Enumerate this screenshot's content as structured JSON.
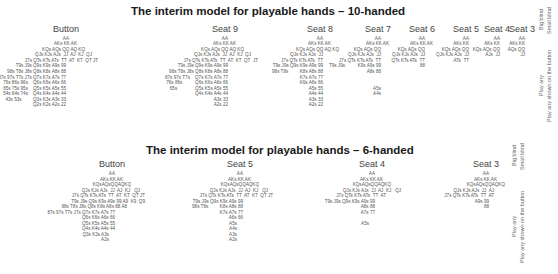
{
  "top": {
    "title": "The interim model for playable hands – 10-handed",
    "seats": [
      {
        "name": "Button",
        "cx": 66,
        "rows": [
          {
            "y": 36,
            "right": 69,
            "text": "AA"
          },
          {
            "y": 41,
            "right": 77,
            "text": "AKs KK AK"
          },
          {
            "y": 47,
            "right": 85,
            "text": "KQs AQs QQ AQ KQ"
          },
          {
            "y": 52,
            "right": 92,
            "text": "QJs KJs AJs  JJ  AJ  KJ  QJ"
          },
          {
            "y": 58,
            "right": 98,
            "text": "J7s QTs KTs ATs  TT  AT  KT  QT JT"
          },
          {
            "y": 63,
            "right": 66,
            "text": "T9s J9s Q9s K9s A9s 99"
          },
          {
            "y": 69,
            "right": 66,
            "text": "98s T8s J8s Q8s K8s A8s 88"
          },
          {
            "y": 75,
            "right": 66,
            "text": "87s 97s T7s J7s Q7s K7s A7s 77"
          },
          {
            "y": 80,
            "right": 66,
            "text": "76s 86s 96s    Q6s K6s A6s 66"
          },
          {
            "y": 86,
            "right": 66,
            "text": "65s 75s 95s    Q5s K5s A5s 55"
          },
          {
            "y": 91,
            "right": 66,
            "text": "54s 64s 74s    Q4s K4s A4s 44"
          },
          {
            "y": 97,
            "right": 66,
            "text": "43s 53s         Q3s K3s A3s 33"
          },
          {
            "y": 102,
            "right": 66,
            "text": "Q2s K2s A2s 22"
          }
        ]
      },
      {
        "name": "Seat 9",
        "cx": 225,
        "rows": [
          {
            "y": 36,
            "right": 228,
            "text": "AA"
          },
          {
            "y": 41,
            "right": 236,
            "text": "AKs KK AK"
          },
          {
            "y": 47,
            "right": 244,
            "text": "KQs AQs QQ AQ KQ"
          },
          {
            "y": 52,
            "right": 251,
            "text": "QJs KJs AJs  JJ  AJ  KJ  QJ"
          },
          {
            "y": 58,
            "right": 258,
            "text": "J7s QTs KTs ATs  TT  AT  KT  QT  JT"
          },
          {
            "y": 63,
            "right": 228,
            "text": "T9s J9s Q9s K9s A9s 99"
          },
          {
            "y": 69,
            "right": 228,
            "text": "98s T8s J8s Q8s K8s A8s 88"
          },
          {
            "y": 75,
            "right": 228,
            "text": "87s 97s T7s    Q7s K7s A7s 77"
          },
          {
            "y": 80,
            "right": 228,
            "text": "76s 86s          Q6s K6s A6s 66"
          },
          {
            "y": 86,
            "right": 228,
            "text": "65s              Q5s K5s A5s 55"
          },
          {
            "y": 91,
            "right": 228,
            "text": "Q4s K4s A4s 44"
          },
          {
            "y": 97,
            "right": 228,
            "text": "A3s 33"
          },
          {
            "y": 102,
            "right": 228,
            "text": "A2s 22"
          }
        ]
      },
      {
        "name": "Seat 8",
        "cx": 320,
        "rows": [
          {
            "y": 36,
            "right": 323,
            "text": "AA"
          },
          {
            "y": 41,
            "right": 331,
            "text": "AKs KK AK"
          },
          {
            "y": 47,
            "right": 339,
            "text": "KQs AQs QQ AQ KQ"
          },
          {
            "y": 52,
            "right": 323,
            "text": "QJs KJs AJs  JJ"
          },
          {
            "y": 58,
            "right": 323,
            "text": "J7s QTs KTs ATs  TT"
          },
          {
            "y": 63,
            "right": 323,
            "text": "T9s J9s Q9s K9s A9s 99"
          },
          {
            "y": 69,
            "right": 323,
            "text": "98s T8s         K8s A8s 88"
          },
          {
            "y": 75,
            "right": 323,
            "text": "K7s A7s 77"
          },
          {
            "y": 80,
            "right": 323,
            "text": "K6s A6s 66"
          },
          {
            "y": 86,
            "right": 323,
            "text": "A5s 55"
          },
          {
            "y": 91,
            "right": 323,
            "text": "A4s 44"
          },
          {
            "y": 97,
            "right": 323,
            "text": "A3s 33"
          },
          {
            "y": 102,
            "right": 323,
            "text": "A2s 22"
          }
        ]
      },
      {
        "name": "Seat 7",
        "cx": 378,
        "rows": [
          {
            "y": 36,
            "right": 381,
            "text": "AA"
          },
          {
            "y": 41,
            "right": 389,
            "text": "AKs KK AK"
          },
          {
            "y": 47,
            "right": 381,
            "text": "KQs AQs QQ"
          },
          {
            "y": 52,
            "right": 381,
            "text": "QJs KJs AJs  JJ"
          },
          {
            "y": 58,
            "right": 381,
            "text": "J7s QTs KTs ATs  TT"
          },
          {
            "y": 63,
            "right": 381,
            "text": "T9s J9s          K9s A9s 99"
          },
          {
            "y": 69,
            "right": 381,
            "text": "A8s 88"
          },
          {
            "y": 86,
            "right": 381,
            "text": "A5s"
          },
          {
            "y": 91,
            "right": 381,
            "text": "A4s"
          }
        ]
      },
      {
        "name": "Seat 6",
        "cx": 422,
        "rows": [
          {
            "y": 36,
            "right": 425,
            "text": "AA"
          },
          {
            "y": 41,
            "right": 433,
            "text": "AKs KK AK"
          },
          {
            "y": 47,
            "right": 425,
            "text": "KQs AQs QQ"
          },
          {
            "y": 52,
            "right": 425,
            "text": "QJs KJs AJs  JJ"
          },
          {
            "y": 58,
            "right": 425,
            "text": "QTs KTs ATs  TT"
          },
          {
            "y": 63,
            "right": 425,
            "text": "88"
          }
        ]
      },
      {
        "name": "Seat 5",
        "cx": 466,
        "rows": [
          {
            "y": 36,
            "right": 469,
            "text": "AA"
          },
          {
            "y": 41,
            "right": 469,
            "text": "AKs KK"
          },
          {
            "y": 47,
            "right": 469,
            "text": "KQs AQs QQ"
          },
          {
            "y": 52,
            "right": 469,
            "text": "QJs KJs AJs  JJ"
          },
          {
            "y": 58,
            "right": 469,
            "text": "ATs  TT"
          }
        ]
      },
      {
        "name": "Seat 4",
        "cx": 497,
        "rows": [
          {
            "y": 36,
            "right": 500,
            "text": "AA"
          },
          {
            "y": 41,
            "right": 500,
            "text": "AKs KK"
          },
          {
            "y": 47,
            "right": 500,
            "text": "KQs AQs QQ"
          },
          {
            "y": 52,
            "right": 500,
            "text": "AJs  JJ"
          }
        ]
      },
      {
        "name": "Seat 3",
        "cx": 522,
        "rows": [
          {
            "y": 36,
            "right": 525,
            "text": "AA"
          },
          {
            "y": 41,
            "right": 525,
            "text": "AKs KK"
          },
          {
            "y": 47,
            "right": 525,
            "text": "AQs QQ"
          },
          {
            "y": 52,
            "right": 525,
            "text": "JJ"
          }
        ]
      }
    ],
    "side_labels": [
      "Big blind",
      "Small blind",
      "Play any",
      "Play any shown on the button"
    ]
  },
  "bottom": {
    "title": "The interim model for playable hands – 6-handed",
    "seats": [
      {
        "name": "Button",
        "cx": 112,
        "rows": [
          {
            "y": 171,
            "right": 115,
            "text": "AA"
          },
          {
            "y": 177,
            "right": 123,
            "text": "AKs KK AK"
          },
          {
            "y": 182,
            "right": 131,
            "text": "KQsAQsQQAQKQ"
          },
          {
            "y": 188,
            "right": 140,
            "text": "QJs KJs AJs  JJ  AJ  KJ   QJ"
          },
          {
            "y": 193,
            "right": 145,
            "text": "J7s QTs KTs ATs  TT  AT  KT  QT JT"
          },
          {
            "y": 199,
            "right": 145,
            "text": "T9s J9s Q9s K9s A9s 99 A9  K9  Q9"
          },
          {
            "y": 204,
            "right": 127,
            "text": "98s T8s J8s Q8s K8s A8s 88 A8"
          },
          {
            "y": 210,
            "right": 115,
            "text": "87s 97s T7s J7s Q7s K7s A7s 77"
          },
          {
            "y": 215,
            "right": 115,
            "text": "Q6s K6s A6s 66"
          },
          {
            "y": 221,
            "right": 115,
            "text": "Q5s K5s A5s 55"
          },
          {
            "y": 226,
            "right": 115,
            "text": "Q4s K4s A4s 44"
          },
          {
            "y": 232,
            "right": 109,
            "text": "Q3s K3s A3s"
          },
          {
            "y": 237,
            "right": 109,
            "text": "A2s"
          }
        ]
      },
      {
        "name": "Seat 5",
        "cx": 240,
        "rows": [
          {
            "y": 171,
            "right": 243,
            "text": "AA"
          },
          {
            "y": 177,
            "right": 251,
            "text": "AKs KK AK"
          },
          {
            "y": 182,
            "right": 259,
            "text": "KQsAQsQQAQKQ"
          },
          {
            "y": 188,
            "right": 268,
            "text": "QJs KJs AJs  JJ  AJ  KJ   QJ"
          },
          {
            "y": 193,
            "right": 273,
            "text": "J7s QTs KTs ATs  TT  AT  KT  QT JT"
          },
          {
            "y": 199,
            "right": 243,
            "text": "T9s J9s Q9s K9s A9s 99"
          },
          {
            "y": 204,
            "right": 243,
            "text": "98s T8s         K8s A8s 88"
          },
          {
            "y": 210,
            "right": 243,
            "text": "K7s A7s 77"
          },
          {
            "y": 215,
            "right": 243,
            "text": "A6s 66"
          },
          {
            "y": 221,
            "right": 237,
            "text": "A5s"
          },
          {
            "y": 226,
            "right": 237,
            "text": "A4s"
          },
          {
            "y": 232,
            "right": 237,
            "text": "A3s"
          },
          {
            "y": 237,
            "right": 237,
            "text": "A2s"
          }
        ]
      },
      {
        "name": "Seat 4",
        "cx": 372,
        "rows": [
          {
            "y": 171,
            "right": 375,
            "text": "AA"
          },
          {
            "y": 177,
            "right": 383,
            "text": "AKs KK AK"
          },
          {
            "y": 182,
            "right": 391,
            "text": "KQsAQsQQAQKQ"
          },
          {
            "y": 188,
            "right": 401,
            "text": "QJs KJs AJs  JJ  AJ  KJ   QJ"
          },
          {
            "y": 193,
            "right": 386,
            "text": "J7s QTs KTs ATs  TT  AT"
          },
          {
            "y": 199,
            "right": 375,
            "text": "T9s J9s Q9s K9s A9s 99"
          },
          {
            "y": 204,
            "right": 375,
            "text": "A8s 88"
          },
          {
            "y": 210,
            "right": 375,
            "text": "A7s 77"
          },
          {
            "y": 221,
            "right": 369,
            "text": "A5s"
          }
        ]
      },
      {
        "name": "Seat 3",
        "cx": 486,
        "rows": [
          {
            "y": 171,
            "right": 489,
            "text": "AA"
          },
          {
            "y": 177,
            "right": 497,
            "text": "AKs KK AK"
          },
          {
            "y": 182,
            "right": 505,
            "text": "KQsAQsQQAQKQ"
          },
          {
            "y": 188,
            "right": 494,
            "text": "QJs KJs AJs  JJ  AJ"
          },
          {
            "y": 193,
            "right": 494,
            "text": "J7s QTs KTs ATs  TT  AT"
          },
          {
            "y": 199,
            "right": 489,
            "text": "A9s 99"
          },
          {
            "y": 204,
            "right": 489,
            "text": "88"
          }
        ]
      }
    ],
    "side_labels": [
      "Big blind",
      "Small blind",
      "Play any",
      "Play any shown on the button"
    ]
  }
}
